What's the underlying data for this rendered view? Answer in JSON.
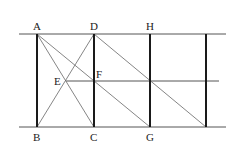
{
  "diagram": {
    "type": "geometry",
    "points": {
      "A": {
        "label": "A",
        "x": 37,
        "y": 34
      },
      "B": {
        "label": "B",
        "x": 37,
        "y": 127
      },
      "C": {
        "label": "C",
        "x": 94,
        "y": 127
      },
      "D": {
        "label": "D",
        "x": 94,
        "y": 34
      },
      "E": {
        "label": "E",
        "x": 66,
        "y": 81
      },
      "F": {
        "label": "F",
        "x": 94,
        "y": 81
      },
      "G": {
        "label": "G",
        "x": 150,
        "y": 127
      },
      "H": {
        "label": "H",
        "x": 150,
        "y": 34
      },
      "P": {
        "label": "",
        "x": 206,
        "y": 34
      },
      "Q": {
        "label": "",
        "x": 206,
        "y": 127
      }
    },
    "labels": [
      "A",
      "B",
      "C",
      "D",
      "E",
      "F",
      "G",
      "H"
    ],
    "horizontal_lines": [
      {
        "name": "top-line",
        "x1": 19,
        "y": 34,
        "x2": 226
      },
      {
        "name": "middle-line",
        "x1": 66,
        "y": 81,
        "x2": 219
      },
      {
        "name": "bottom-line",
        "x1": 19,
        "y": 127,
        "x2": 226
      }
    ],
    "vertical_segments": [
      "AB",
      "DC",
      "HG",
      "PQ"
    ],
    "diagonals": [
      "AC",
      "AG",
      "DB",
      "DQ"
    ],
    "colors": {
      "bold_line": "#1a1a1a",
      "thin_line": "#555555",
      "bg": "#ffffff"
    }
  }
}
